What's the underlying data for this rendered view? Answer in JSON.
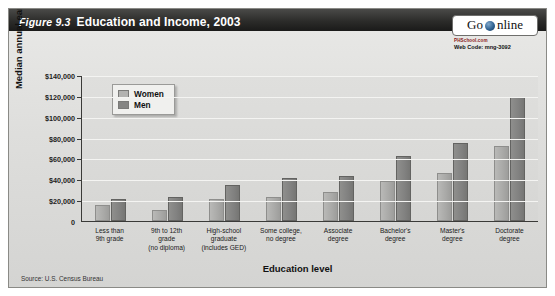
{
  "figure": {
    "number_label": "Figure 9.3",
    "title": "Education and Income, 2003",
    "source": "Source: U.S. Census Bureau"
  },
  "badge": {
    "go_text": "Go",
    "online_text": "nline",
    "globe_icon": "globe-icon",
    "site": "PHSchool.com",
    "web_code": "Web Code: mng-3092"
  },
  "chart_data": {
    "type": "bar",
    "title": "Education and Income, 2003",
    "xlabel": "Education level",
    "ylabel": "Median annual earnings",
    "ylim": [
      0,
      140000
    ],
    "ytick_labels": [
      "$140,000",
      "$120,000",
      "$100,000",
      "$80,000",
      "$60,000",
      "$40,000",
      "$20,000",
      "0"
    ],
    "ytick_values": [
      140000,
      120000,
      100000,
      80000,
      60000,
      40000,
      20000,
      0
    ],
    "grid": true,
    "legend_position": "upper-left",
    "categories": [
      "Less than\n9th grade",
      "9th to 12th\ngrade\n(no diploma)",
      "High-school\ngraduate\n(includes GED)",
      "Some college,\nno degree",
      "Associate\ndegree",
      "Bachelor's\ndegree",
      "Master's\ndegree",
      "Doctorate\ndegree"
    ],
    "series": [
      {
        "name": "Women",
        "values": [
          15000,
          11000,
          21000,
          23000,
          28000,
          38000,
          46000,
          72000
        ]
      },
      {
        "name": "Men",
        "values": [
          21000,
          23000,
          35000,
          41000,
          43000,
          62000,
          75000,
          119000
        ]
      }
    ]
  },
  "axis_ticks": [
    {
      "label": "$140,000",
      "value": 140000
    },
    {
      "label": "$120,000",
      "value": 120000
    },
    {
      "label": "$100,000",
      "value": 100000
    },
    {
      "label": "$80,000",
      "value": 80000
    },
    {
      "label": "$60,000",
      "value": 60000
    },
    {
      "label": "$40,000",
      "value": 40000
    },
    {
      "label": "$20,000",
      "value": 20000
    },
    {
      "label": "0",
      "value": 0
    }
  ],
  "colors": {
    "header_bg": "#2c2c2a",
    "panel_bg": "#dedede",
    "women_bar": "#aeaeac",
    "men_bar": "#828280",
    "axis": "#3a3a38",
    "gridline": "#f4f4f2"
  }
}
